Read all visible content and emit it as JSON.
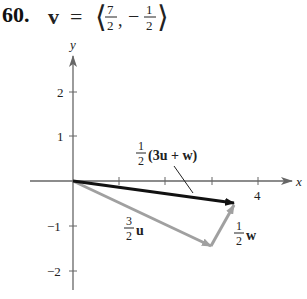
{
  "problem": {
    "number": "60.",
    "vector_name": "v",
    "equals": "=",
    "components": {
      "x_num": "7",
      "x_den": "2",
      "y_sign": "−",
      "y_num": "1",
      "y_den": "2"
    }
  },
  "axes": {
    "x_label": "x",
    "y_label": "y",
    "x_tick_labels": [
      {
        "value": 4,
        "text": "4"
      }
    ],
    "y_tick_labels": [
      {
        "value": 2,
        "text": "2"
      },
      {
        "value": 1,
        "text": "1"
      },
      {
        "value": -1,
        "text": "−1"
      },
      {
        "value": -2,
        "text": "−2"
      }
    ]
  },
  "vectors": [
    {
      "name": "half-3u-plus-w",
      "label_coef_num": "1",
      "label_coef_den": "2",
      "label_expr": "(3u + w)",
      "from": [
        0,
        0
      ],
      "to": [
        3.5,
        -0.5
      ],
      "color": "#111111"
    },
    {
      "name": "three-halves-u",
      "label_coef_num": "3",
      "label_coef_den": "2",
      "label_expr": "u",
      "from": [
        0,
        0
      ],
      "to": [
        3,
        -1.5
      ],
      "color": "#a0a0a0"
    },
    {
      "name": "half-w",
      "label_coef_num": "1",
      "label_coef_den": "2",
      "label_expr": "w",
      "from": [
        3,
        -1.5
      ],
      "to": [
        3.5,
        -0.5
      ],
      "color": "#a0a0a0"
    }
  ]
}
